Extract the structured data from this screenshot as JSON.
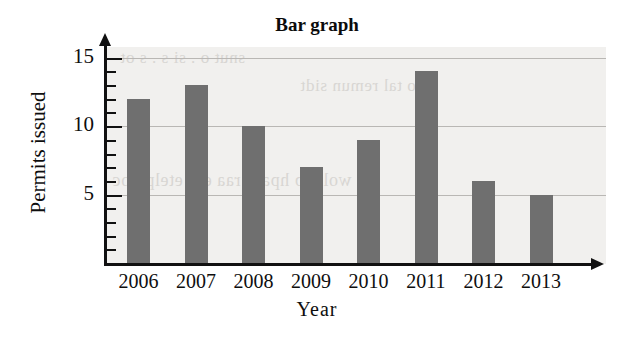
{
  "chart_data": {
    "type": "bar",
    "title": "Bar graph",
    "xlabel": "Year",
    "ylabel": "Permits issued",
    "categories": [
      "2006",
      "2007",
      "2008",
      "2009",
      "2010",
      "2011",
      "2012",
      "2013"
    ],
    "values": [
      12,
      13,
      10,
      7,
      9,
      14,
      6,
      5
    ],
    "ylim": [
      0,
      16
    ],
    "y_major_ticks": [
      5,
      10,
      15
    ],
    "y_tick_labels": [
      "5",
      "10",
      "15"
    ],
    "y_minor_tick_interval": 1,
    "grid": true,
    "grid_axis": "y",
    "legend": false,
    "bar_color": "#6f6f6f",
    "gridline_color": "#b9b7b4",
    "axis_color": "#111111",
    "plot_background": "#f1f0ee",
    "axis_arrows": true
  },
  "ghost_text": {
    "line1": "snut  o  .  si         s  .  s      ot",
    "line2": "ano tal remun sidt",
    "line3": "ot wol e b hparg raa eht etelpmoc"
  }
}
